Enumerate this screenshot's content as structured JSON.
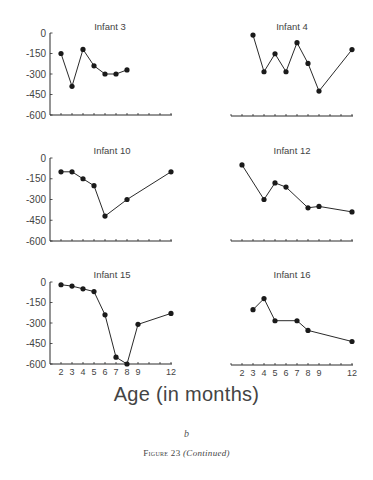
{
  "chart_data": {
    "type": "line",
    "layout": "3x2 small multiples",
    "xlabel": "Age (in months)",
    "ylabel": "",
    "ylim": [
      -600,
      0
    ],
    "yticks": [
      0,
      -150,
      -300,
      -450,
      -600
    ],
    "yticklabels": [
      "0",
      "-150",
      "-300",
      "-450",
      "-600"
    ],
    "xticks": [
      2,
      3,
      4,
      5,
      6,
      7,
      8,
      9,
      10,
      11,
      12
    ],
    "xticklabels": [
      "2",
      "3",
      "4",
      "5",
      "6",
      "7",
      "8",
      "9",
      "12"
    ],
    "xlim": [
      1,
      12
    ],
    "grid": false,
    "panels": [
      {
        "title": "Infant 3",
        "x": [
          2,
          3,
          4,
          5,
          6,
          7,
          8
        ],
        "y": [
          -150,
          -390,
          -120,
          -240,
          -300,
          -300,
          -270
        ]
      },
      {
        "title": "Infant 4",
        "x": [
          3,
          4,
          5,
          6,
          7,
          8,
          9,
          12
        ],
        "y": [
          -15,
          -280,
          -150,
          -280,
          -70,
          -220,
          -420,
          -120
        ]
      },
      {
        "title": "Infant 10",
        "x": [
          2,
          3,
          4,
          5,
          6,
          8,
          12
        ],
        "y": [
          -100,
          -100,
          -150,
          -200,
          -420,
          -300,
          -100
        ]
      },
      {
        "title": "Infant 12",
        "x": [
          2,
          4,
          5,
          6,
          8,
          9,
          12
        ],
        "y": [
          -50,
          -300,
          -180,
          -210,
          -360,
          -350,
          -390
        ]
      },
      {
        "title": "Infant 15",
        "x": [
          2,
          3,
          4,
          5,
          6,
          7,
          8,
          9,
          12
        ],
        "y": [
          -20,
          -30,
          -50,
          -70,
          -240,
          -550,
          -600,
          -310,
          -230
        ]
      },
      {
        "title": "Infant 16",
        "x": [
          3,
          4,
          5,
          7,
          8,
          12
        ],
        "y": [
          -200,
          -120,
          -280,
          -280,
          -350,
          -430
        ]
      }
    ]
  },
  "figure": {
    "xlabel": "Age (in months)",
    "sublabel": "b",
    "caption_prefix": "Figure 23",
    "caption_suffix": "(Continued)"
  }
}
